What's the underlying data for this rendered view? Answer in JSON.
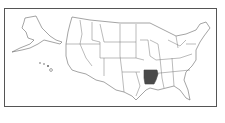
{
  "map": {
    "title": "United States locator map",
    "highlighted_state": "Arkansas",
    "highlight_color": "#4a4a4a",
    "state_fill": "#ffffff",
    "border_color": "#666666",
    "insets": [
      "Alaska",
      "Hawaii"
    ]
  }
}
